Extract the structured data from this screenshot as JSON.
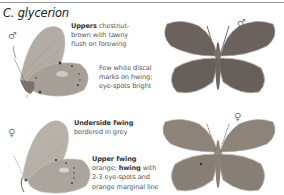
{
  "page": {
    "title": "C. glycerion",
    "colors": {
      "rule": "#9a9a9a",
      "male_upperside": "#6b625d",
      "female_upperside": "#8a8076",
      "underside_hindwing": "#a9a39c",
      "underside_forewing": "#b5aea6"
    }
  },
  "male": {
    "symbol": "♂",
    "symbol_upper": "♂",
    "notes": [
      {
        "bold": "Uppers",
        "lines": [
          " chestnut-",
          "brown with tawny",
          "flush on forewing"
        ]
      },
      {
        "bold": "",
        "lines": [
          "Few white discal",
          "marks on hwing;",
          "eye-spots bright"
        ]
      }
    ]
  },
  "female": {
    "symbol": "♀",
    "symbol_upper": "♀",
    "notes": [
      {
        "bold": "Underside fwing",
        "lines": [
          "bordered in grey"
        ]
      },
      {
        "bold": "Upper fwing",
        "line2_pre": "orange; ",
        "line2_bold": "hwing",
        "line2_post": " with",
        "lines": [
          "2-3 eye-spots and",
          "orange marginal line"
        ]
      }
    ]
  },
  "figures": [
    {
      "name": "male-underside",
      "view": "underside"
    },
    {
      "name": "male-upperside",
      "view": "upperside"
    },
    {
      "name": "female-underside",
      "view": "underside"
    },
    {
      "name": "female-upperside",
      "view": "upperside"
    }
  ]
}
